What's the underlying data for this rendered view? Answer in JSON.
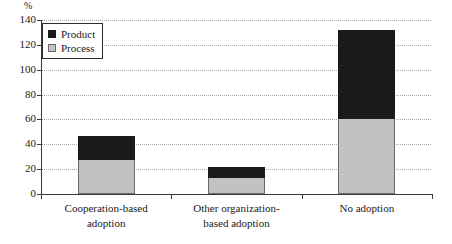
{
  "chart_data": {
    "type": "bar",
    "subtype": "stacked",
    "title": "",
    "xlabel": "",
    "ylabel": "",
    "unit_label": "%",
    "ylim": [
      0,
      140
    ],
    "yticks": [
      0,
      20,
      40,
      60,
      80,
      100,
      120,
      140
    ],
    "ytick_labels": [
      "0",
      "20",
      "40",
      "60",
      "80",
      "100",
      "120",
      "140"
    ],
    "grid": true,
    "grid_style": "dotted-horizontal",
    "legend_position": "top-left",
    "categories": [
      "Cooperation-based adoption",
      "Other organization-based adoption",
      "No adoption"
    ],
    "category_lines": [
      [
        "Cooperation-based",
        "adoption"
      ],
      [
        "Other organization-",
        "based adoption"
      ],
      [
        "No adoption",
        ""
      ]
    ],
    "series": [
      {
        "name": "Process",
        "color": "#c2c2c2",
        "values": [
          27,
          13,
          60
        ]
      },
      {
        "name": "Product",
        "color": "#1a1a1a",
        "values": [
          19,
          8,
          71
        ]
      }
    ],
    "totals": [
      46,
      21,
      131
    ]
  },
  "legend": {
    "entries": [
      {
        "label": "Product",
        "swatch": "black-square-icon"
      },
      {
        "label": "Process",
        "swatch": "gray-square-icon"
      }
    ]
  }
}
